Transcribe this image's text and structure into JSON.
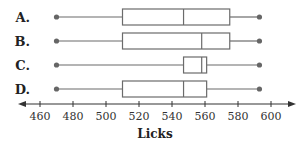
{
  "chart_data": {
    "type": "boxplot",
    "title": "",
    "xlabel": "Licks",
    "ylabel": "",
    "xlim": [
      455,
      610
    ],
    "x_ticks": [
      460,
      480,
      500,
      520,
      540,
      560,
      580,
      600
    ],
    "grid": false,
    "legend": null,
    "orientation": "horizontal",
    "series": [
      {
        "name": "A.",
        "min": 470,
        "q1": 510,
        "median": 547,
        "q3": 575,
        "max": 593
      },
      {
        "name": "B.",
        "min": 470,
        "q1": 510,
        "median": 558,
        "q3": 575,
        "max": 593
      },
      {
        "name": "C.",
        "min": 470,
        "q1": 547,
        "median": 558,
        "q3": 561,
        "max": 593
      },
      {
        "name": "D.",
        "min": 470,
        "q1": 510,
        "median": 547,
        "q3": 561,
        "max": 593
      }
    ]
  },
  "style": {
    "line_color": "#6b6b6b",
    "dot_color": "#666666",
    "axis_color": "#333333",
    "text_color": "#222222"
  }
}
